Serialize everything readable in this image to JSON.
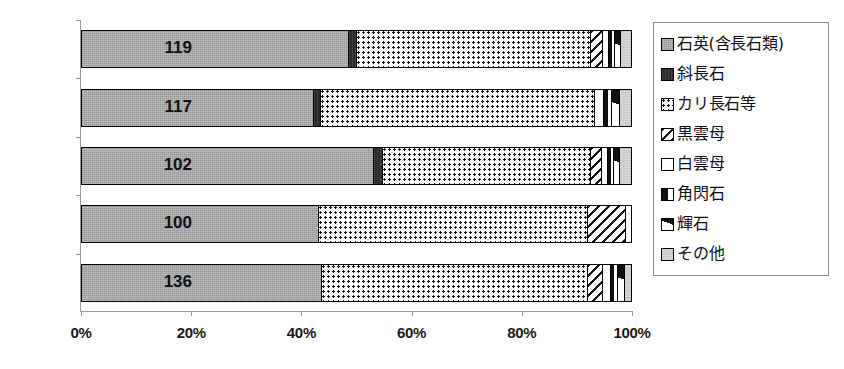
{
  "chart_data": {
    "type": "bar",
    "orientation": "horizontal",
    "stacked": true,
    "normalized": true,
    "title": "",
    "xlabel": "",
    "ylabel": "",
    "xlim": [
      0,
      100
    ],
    "xticks": [
      0,
      20,
      40,
      60,
      80,
      100
    ],
    "xtick_labels": [
      "0%",
      "20%",
      "40%",
      "60%",
      "80%",
      "100%"
    ],
    "grid": false,
    "legend_position": "right",
    "categories": [
      "119",
      "117",
      "102",
      "100",
      "136"
    ],
    "series": [
      {
        "name": "石英(含長石類)",
        "swatch": "quartz-swatch",
        "values": [
          48.5,
          42.0,
          53.0,
          43.0,
          43.5
        ]
      },
      {
        "name": "斜長石",
        "swatch": "plagioclase-swatch",
        "values": [
          1.4,
          1.4,
          1.7,
          0.0,
          0.0
        ]
      },
      {
        "name": "カリ長石等",
        "swatch": "k-feldspar-swatch",
        "values": [
          42.6,
          49.9,
          37.8,
          49.0,
          48.5
        ]
      },
      {
        "name": "黒雲母",
        "swatch": "biotite-swatch",
        "values": [
          2.2,
          0.0,
          2.0,
          7.0,
          2.8
        ]
      },
      {
        "name": "白雲母",
        "swatch": "muscovite-swatch",
        "values": [
          1.1,
          1.6,
          1.2,
          1.0,
          1.4
        ]
      },
      {
        "name": "角閃石",
        "swatch": "hornblende-swatch",
        "values": [
          1.2,
          1.5,
          1.1,
          0.0,
          1.3
        ]
      },
      {
        "name": "輝石",
        "swatch": "pyroxene-swatch",
        "values": [
          1.0,
          1.4,
          1.1,
          0.0,
          1.3
        ]
      },
      {
        "name": "その他",
        "swatch": "other-swatch",
        "values": [
          2.0,
          2.2,
          2.1,
          0.0,
          1.2
        ]
      }
    ]
  },
  "legend": {
    "items": [
      {
        "label": "石英(含長石類)"
      },
      {
        "label": "斜長石"
      },
      {
        "label": "カリ長石等"
      },
      {
        "label": "黒雲母"
      },
      {
        "label": "白雲母"
      },
      {
        "label": "角閃石"
      },
      {
        "label": "輝石"
      },
      {
        "label": "その他"
      }
    ]
  },
  "colors": {
    "quartz": "#a8a8a8",
    "plagioclase": "#2b2b2b",
    "k_feldspar": "#fbfbfb",
    "biotite": "#ffffff",
    "muscovite": "#ffffff",
    "hornblende": "#ffffff",
    "pyroxene": "#ffffff",
    "other": "#c9c9c9",
    "axis": "#9a9a9a",
    "outline": "#000000"
  }
}
